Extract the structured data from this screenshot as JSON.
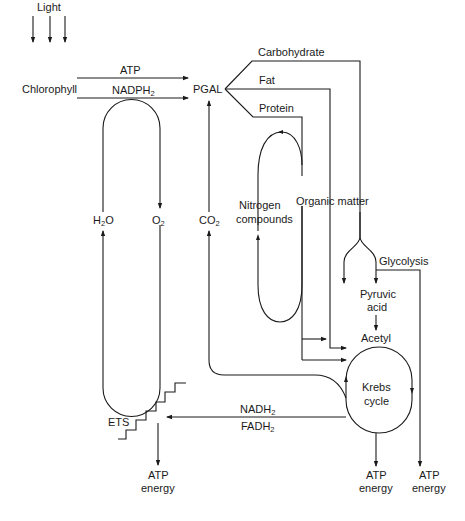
{
  "diagram": {
    "labels": {
      "light": "Light",
      "chlorophyll": "Chlorophyll",
      "atp": "ATP",
      "nadph": "NADPH",
      "nadph_sub": "2",
      "pgal": "PGAL",
      "carbohydrate": "Carbohydrate",
      "fat": "Fat",
      "protein": "Protein",
      "h2o_h": "H",
      "h2o_sub": "2",
      "h2o_o": "O",
      "o2": "O",
      "o2_sub": "2",
      "co2": "CO",
      "co2_sub": "2",
      "nitrogen_1": "Nitrogen",
      "nitrogen_2": "compounds",
      "organic_matter": "Organic matter",
      "glycolysis": "Glycolysis",
      "pyruvic_1": "Pyruvic",
      "pyruvic_2": "acid",
      "acetyl": "Acetyl",
      "krebs_1": "Krebs",
      "krebs_2": "cycle",
      "ets": "ETS",
      "nadh": "NADH",
      "nadh_sub": "2",
      "fadh": "FADH",
      "fadh_sub": "2",
      "atp_energy_ets_1": "ATP",
      "atp_energy_ets_2": "energy",
      "atp_energy_krebs_1": "ATP",
      "atp_energy_krebs_2": "energy",
      "atp_energy_glyco_1": "ATP",
      "atp_energy_glyco_2": "energy"
    },
    "colors": {
      "line": "#1a1a1a",
      "background": "#ffffff"
    }
  }
}
